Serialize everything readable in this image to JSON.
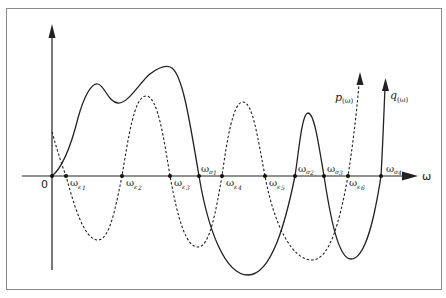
{
  "diagram": {
    "title": "",
    "x_axis_label": "ω",
    "origin_label": "0",
    "colors": {
      "line": "#222222",
      "frame": "#8a8a8a",
      "background": "#ffffff"
    },
    "curves": [
      {
        "id": "p",
        "label_main": "p",
        "label_arg": "(ω)",
        "style": "dashed"
      },
      {
        "id": "q",
        "label_main": "q",
        "label_arg": "(ω)",
        "style": "solid"
      }
    ],
    "epsilon_points": [
      {
        "base": "ω",
        "sub": "ε",
        "idx": "1"
      },
      {
        "base": "ω",
        "sub": "ε",
        "idx": "2"
      },
      {
        "base": "ω",
        "sub": "ε",
        "idx": "3"
      },
      {
        "base": "ω",
        "sub": "ε",
        "idx": "4"
      },
      {
        "base": "ω",
        "sub": "ε",
        "idx": "5"
      },
      {
        "base": "ω",
        "sub": "ε",
        "idx": "6"
      }
    ],
    "sigma_points": [
      {
        "base": "ω",
        "sub": "σ",
        "idx": "1"
      },
      {
        "base": "ω",
        "sub": "σ",
        "idx": "2"
      },
      {
        "base": "ω",
        "sub": "σ",
        "idx": "3"
      },
      {
        "base": "ω",
        "sub": "σ",
        "idx": "4"
      }
    ]
  }
}
